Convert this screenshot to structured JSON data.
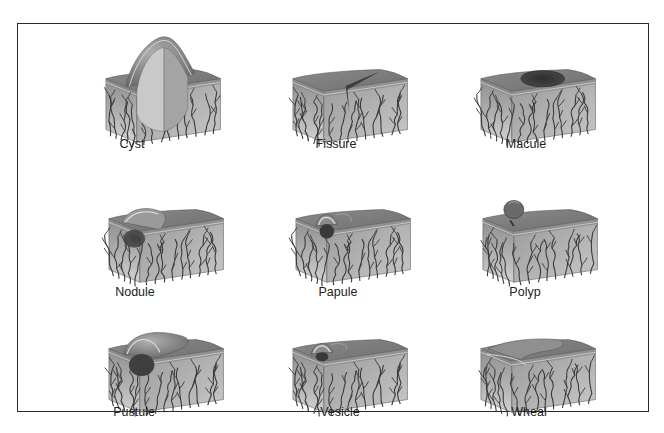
{
  "figure": {
    "lesions": [
      {
        "id": "cyst",
        "label": "Cyst",
        "feature": "large dome cyst"
      },
      {
        "id": "fissure",
        "label": "Fissure",
        "feature": "linear crack"
      },
      {
        "id": "macule",
        "label": "Macule",
        "feature": "flat dark spot"
      },
      {
        "id": "nodule",
        "label": "Nodule",
        "feature": "raised solid mass"
      },
      {
        "id": "papule",
        "label": "Papule",
        "feature": "small raised bump"
      },
      {
        "id": "polyp",
        "label": "Polyp",
        "feature": "stalked growth"
      },
      {
        "id": "pustule",
        "label": "Pustule",
        "feature": "pus-filled raised lesion"
      },
      {
        "id": "vesicle",
        "label": "Vesicle",
        "feature": "small fluid blister"
      },
      {
        "id": "wheal",
        "label": "Wheal",
        "feature": "flat raised swelling"
      }
    ]
  },
  "colors": {
    "surface": "#7d7d7d",
    "side_light": "#bdbdbd",
    "side_dark": "#8a8a8a",
    "vessel": "#3a3a3a",
    "frame": "#2a2a2a"
  }
}
